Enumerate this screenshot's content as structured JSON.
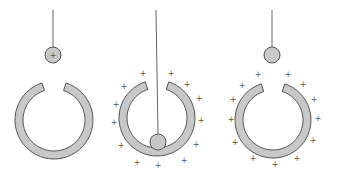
{
  "colors": {
    "ring_fill": "#c8c8c8",
    "stroke": "#555555",
    "string": "#666666",
    "ball_fill": "#c8c8c8",
    "plus": "#555555"
  },
  "charge_symbol": "+",
  "panels": [
    {
      "id": "panel-1",
      "ring": {
        "cx": 54,
        "cy": 120,
        "r_outer": 39,
        "r_inner": 31
      },
      "string": {
        "x1": 53,
        "y1": 10,
        "x2": 53,
        "y2": 47
      },
      "ball": {
        "cx": 53,
        "cy": 55,
        "r": 8,
        "label": "+"
      },
      "ring_charges": []
    },
    {
      "id": "panel-2",
      "ring": {
        "cx": 157,
        "cy": 118,
        "r_outer": 38,
        "r_inner": 30
      },
      "string": {
        "x1": 156,
        "y1": 10,
        "x2": 158,
        "y2": 134
      },
      "ball": {
        "cx": 158,
        "cy": 142,
        "r": 8,
        "label": ""
      },
      "ring_charges": [
        [
          143,
          73
        ],
        [
          171,
          73
        ],
        [
          124,
          86
        ],
        [
          187,
          84
        ],
        [
          116,
          104
        ],
        [
          199,
          98
        ],
        [
          114,
          122
        ],
        [
          201,
          120
        ],
        [
          121,
          145
        ],
        [
          196,
          144
        ],
        [
          137,
          162
        ],
        [
          184,
          160
        ],
        [
          158,
          165
        ]
      ]
    },
    {
      "id": "panel-3",
      "ring": {
        "cx": 273,
        "cy": 120,
        "r_outer": 38,
        "r_inner": 30
      },
      "string": {
        "x1": 272,
        "y1": 10,
        "x2": 272,
        "y2": 47
      },
      "ball": {
        "cx": 272,
        "cy": 55,
        "r": 8,
        "label": ""
      },
      "ring_charges": [
        [
          258,
          74
        ],
        [
          288,
          74
        ],
        [
          242,
          85
        ],
        [
          303,
          84
        ],
        [
          233,
          99
        ],
        [
          314,
          99
        ],
        [
          231,
          119
        ],
        [
          318,
          118
        ],
        [
          235,
          142
        ],
        [
          313,
          140
        ],
        [
          253,
          158
        ],
        [
          297,
          158
        ],
        [
          275,
          164
        ]
      ]
    }
  ]
}
